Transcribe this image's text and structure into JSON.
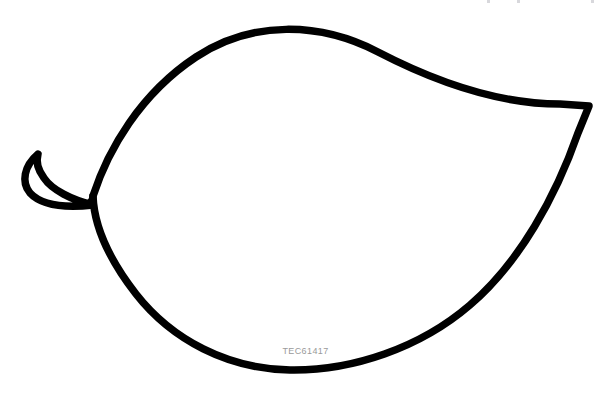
{
  "page": {
    "width": 611,
    "height": 400,
    "background_color": "#ffffff"
  },
  "artwork": {
    "name": "leaf-outline",
    "description": "Simple black line-art outline of a single leaf with a hooked stem on the left and a pointed tip on the right",
    "stroke_color": "#000000",
    "fill_color": "#ffffff",
    "stroke_width": 7.5,
    "parts": [
      {
        "name": "leaf-blade",
        "label": "Leaf blade outline"
      },
      {
        "name": "leaf-stem",
        "label": "Leaf stem hook"
      }
    ]
  },
  "watermark": {
    "text": "TEC61417",
    "color": "#9a9a9a",
    "font_size": 9
  },
  "artifacts": {
    "top_edge_marks": [
      {
        "x": 487
      },
      {
        "x": 517
      },
      {
        "x": 591
      }
    ]
  }
}
